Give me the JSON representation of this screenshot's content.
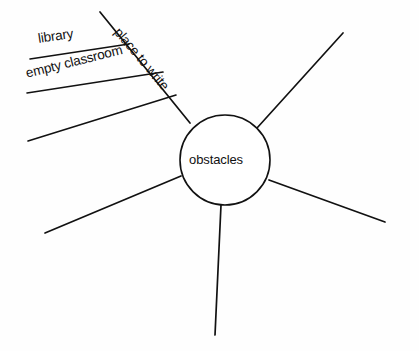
{
  "diagram": {
    "type": "spider-web-brainstorm",
    "center": {
      "label": "obstacles",
      "cx": 225,
      "cy": 160,
      "r": 45
    },
    "spokes": [
      {
        "name": "upper-left-main",
        "label": "place to write",
        "x1": 190,
        "y1": 123,
        "x2": 100,
        "y2": 12
      },
      {
        "name": "upper-right",
        "label": "",
        "x1": 257,
        "y1": 128,
        "x2": 343,
        "y2": 33
      },
      {
        "name": "lower-right",
        "label": "",
        "x1": 269,
        "y1": 180,
        "x2": 385,
        "y2": 222
      },
      {
        "name": "lower-left",
        "label": "",
        "x1": 181,
        "y1": 176,
        "x2": 45,
        "y2": 233
      },
      {
        "name": "bottom",
        "label": "",
        "x1": 221,
        "y1": 205,
        "x2": 215,
        "y2": 335
      }
    ],
    "branches": [
      {
        "name": "library",
        "label": "library",
        "x1": 129,
        "y1": 44,
        "x2": 30,
        "y2": 59
      },
      {
        "name": "empty-classroom",
        "label": "empty classroom",
        "x1": 163,
        "y1": 72,
        "x2": 27,
        "y2": 93
      },
      {
        "name": "unlabeled-third",
        "label": "",
        "x1": 176,
        "y1": 95,
        "x2": 28,
        "y2": 141
      }
    ]
  },
  "colors": {
    "ink": "#111111",
    "paper": "#fefefe"
  }
}
